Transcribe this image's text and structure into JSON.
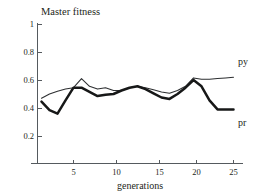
{
  "chart_data": {
    "type": "line",
    "title": "Master fitness",
    "subtitle": "",
    "xlabel": "generations",
    "ylabel": "",
    "xlim": [
      0,
      26
    ],
    "ylim": [
      0,
      1
    ],
    "grid": false,
    "legend_position": "right-inline",
    "x_ticks": [
      5,
      10,
      15,
      20,
      25
    ],
    "x_tick_labels": [
      "5",
      "10",
      "15",
      "20",
      "25"
    ],
    "y_ticks": [
      0.2,
      0.4,
      0.6,
      0.8,
      1
    ],
    "y_tick_labels": [
      "0.2",
      "0.4",
      "0.6",
      "0.8",
      "1"
    ],
    "x": [
      1,
      2,
      3,
      4,
      5,
      6,
      7,
      8,
      9,
      10,
      11,
      12,
      13,
      14,
      15,
      16,
      17,
      18,
      19,
      20,
      21,
      22,
      23,
      24,
      25
    ],
    "series": [
      {
        "name": "py",
        "label": "py",
        "style": "thin",
        "color": "#2d2f31",
        "values": [
          0.47,
          0.5,
          0.52,
          0.535,
          0.545,
          0.61,
          0.555,
          0.535,
          0.545,
          0.525,
          0.525,
          0.545,
          0.555,
          0.545,
          0.53,
          0.515,
          0.505,
          0.525,
          0.555,
          0.615,
          0.605,
          0.605,
          0.61,
          0.615,
          0.62
        ]
      },
      {
        "name": "pr",
        "label": "pr",
        "style": "thick",
        "color": "#171818",
        "values": [
          0.445,
          0.385,
          0.36,
          0.455,
          0.545,
          0.545,
          0.515,
          0.485,
          0.495,
          0.5,
          0.525,
          0.545,
          0.555,
          0.535,
          0.505,
          0.475,
          0.465,
          0.5,
          0.545,
          0.6,
          0.555,
          0.455,
          0.39,
          0.39,
          0.39
        ]
      }
    ]
  }
}
